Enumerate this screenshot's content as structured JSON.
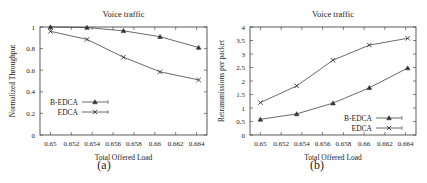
{
  "chart_data": [
    {
      "type": "line",
      "panel": "(a)",
      "title": "Voice traffic",
      "xlabel": "Total Offered Load",
      "ylabel": "Normalized Throughput",
      "xlim": [
        0.649,
        0.665
      ],
      "ylim": [
        0,
        1
      ],
      "xticks": [
        "0.65",
        "0.652",
        "0.654",
        "0.656",
        "0.658",
        "0.66",
        "0.662",
        "0.664"
      ],
      "yticks": [
        "0",
        "0.2",
        "0.4",
        "0.6",
        "0.8",
        "1"
      ],
      "x": [
        0.65,
        0.6535,
        0.657,
        0.6605,
        0.6642
      ],
      "series": [
        {
          "name": "B-EDCA",
          "marker": "triangle",
          "values": [
            1.0,
            0.995,
            0.965,
            0.91,
            0.81
          ]
        },
        {
          "name": "EDCA",
          "marker": "x",
          "values": [
            0.96,
            0.885,
            0.72,
            0.585,
            0.51
          ]
        }
      ],
      "legend_position": "lower left",
      "grid": false
    },
    {
      "type": "line",
      "panel": "(b)",
      "title": "Voice traffic",
      "xlabel": "Total Offered Load",
      "ylabel": "Retransmissions per packet",
      "xlim": [
        0.649,
        0.665
      ],
      "ylim": [
        0,
        4
      ],
      "xticks": [
        "0.65",
        "0.652",
        "0.654",
        "0.656",
        "0.658",
        "0.66",
        "0.662",
        "0.664"
      ],
      "yticks": [
        "0",
        "0.5",
        "1",
        "1.5",
        "2",
        "2.5",
        "3",
        "3.5",
        "4"
      ],
      "x": [
        0.65,
        0.6535,
        0.657,
        0.6605,
        0.6642
      ],
      "series": [
        {
          "name": "B-EDCA",
          "marker": "triangle",
          "values": [
            0.58,
            0.78,
            1.18,
            1.75,
            2.48
          ]
        },
        {
          "name": "EDCA",
          "marker": "x",
          "values": [
            1.2,
            1.82,
            2.77,
            3.33,
            3.58
          ]
        }
      ],
      "legend_position": "lower right",
      "grid": false
    }
  ],
  "captions": {
    "a": "(a)",
    "b": "(b)"
  }
}
